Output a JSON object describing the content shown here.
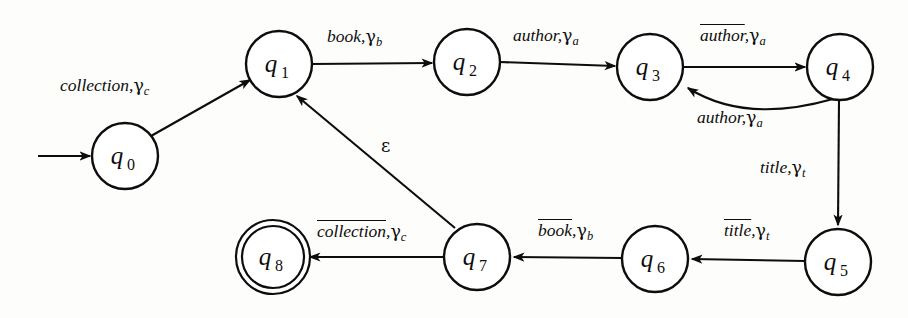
{
  "diagram": {
    "kind": "finite-state-transducer",
    "title": "",
    "background_color": "#fdfdfb",
    "stroke_color": "#0d0d0d",
    "states": [
      {
        "id": "q0",
        "label": "q",
        "sub": "0",
        "cx": 125,
        "cy": 156,
        "r": 33,
        "accepting": false,
        "start": true
      },
      {
        "id": "q1",
        "label": "q",
        "sub": "1",
        "cx": 279,
        "cy": 64,
        "r": 33,
        "accepting": false,
        "start": false
      },
      {
        "id": "q2",
        "label": "q",
        "sub": "2",
        "cx": 467,
        "cy": 62,
        "r": 33,
        "accepting": false,
        "start": false
      },
      {
        "id": "q3",
        "label": "q",
        "sub": "3",
        "cx": 650,
        "cy": 67,
        "r": 33,
        "accepting": false,
        "start": false
      },
      {
        "id": "q4",
        "label": "q",
        "sub": "4",
        "cx": 840,
        "cy": 67,
        "r": 33,
        "accepting": false,
        "start": false
      },
      {
        "id": "q5",
        "label": "q",
        "sub": "5",
        "cx": 838,
        "cy": 262,
        "r": 33,
        "accepting": false,
        "start": false
      },
      {
        "id": "q6",
        "label": "q",
        "sub": "6",
        "cx": 655,
        "cy": 259,
        "r": 33,
        "accepting": false,
        "start": false
      },
      {
        "id": "q7",
        "label": "q",
        "sub": "7",
        "cx": 477,
        "cy": 257,
        "r": 33,
        "accepting": false,
        "start": false
      },
      {
        "id": "q8",
        "label": "q",
        "sub": "8",
        "cx": 273,
        "cy": 257,
        "r": 32,
        "accepting": true,
        "start": false
      }
    ],
    "transitions": [
      {
        "id": "t-start",
        "from": "",
        "to": "q0",
        "input": "",
        "negated": false,
        "stack": "",
        "label_x": 0,
        "label_y": 0
      },
      {
        "id": "t-q0-q1",
        "from": "q0",
        "to": "q1",
        "input": "collection",
        "negated": false,
        "stack": "c",
        "label_x": 60,
        "label_y": 76
      },
      {
        "id": "t-q1-q2",
        "from": "q1",
        "to": "q2",
        "input": "book",
        "negated": false,
        "stack": "b",
        "label_x": 327,
        "label_y": 27
      },
      {
        "id": "t-q2-q3",
        "from": "q2",
        "to": "q3",
        "input": "author",
        "negated": false,
        "stack": "a",
        "label_x": 513,
        "label_y": 26
      },
      {
        "id": "t-q3-q4",
        "from": "q3",
        "to": "q4",
        "input": "author",
        "negated": true,
        "stack": "a",
        "label_x": 700,
        "label_y": 26
      },
      {
        "id": "t-q4-q3",
        "from": "q4",
        "to": "q3",
        "input": "author",
        "negated": false,
        "stack": "a",
        "label_x": 697,
        "label_y": 108
      },
      {
        "id": "t-q4-q5",
        "from": "q4",
        "to": "q5",
        "input": "title",
        "negated": false,
        "stack": "t",
        "label_x": 760,
        "label_y": 158
      },
      {
        "id": "t-q5-q6",
        "from": "q5",
        "to": "q6",
        "input": "title",
        "negated": true,
        "stack": "t",
        "label_x": 724,
        "label_y": 221
      },
      {
        "id": "t-q6-q7",
        "from": "q6",
        "to": "q7",
        "input": "book",
        "negated": true,
        "stack": "b",
        "label_x": 538,
        "label_y": 221
      },
      {
        "id": "t-q7-q8",
        "from": "q7",
        "to": "q8",
        "input": "collection",
        "negated": true,
        "stack": "c",
        "label_x": 317,
        "label_y": 222
      },
      {
        "id": "t-q7-q1",
        "from": "q7",
        "to": "q1",
        "input": "epsilon",
        "negated": false,
        "stack": "",
        "label_x": 381,
        "label_y": 137
      }
    ],
    "labels": {
      "collection_c": {
        "word": "collection",
        "gamma": "γ",
        "sub": "c"
      },
      "book_b": {
        "word": "book",
        "gamma": "γ",
        "sub": "b"
      },
      "author_a": {
        "word": "author",
        "gamma": "γ",
        "sub": "a"
      },
      "title_t": {
        "word": "title",
        "gamma": "γ",
        "sub": "t"
      },
      "epsilon": {
        "word": "ε"
      },
      "comma": ","
    }
  }
}
